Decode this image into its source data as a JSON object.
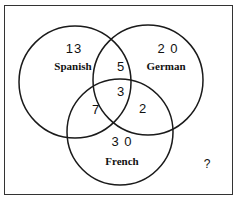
{
  "diagram": {
    "type": "venn",
    "sets": [
      {
        "name": "Spanish",
        "only": "13",
        "cx": 75,
        "cy": 82,
        "r": 56
      },
      {
        "name": "German",
        "only": "20",
        "cx": 148,
        "cy": 80,
        "r": 55
      },
      {
        "name": "French",
        "only": "30",
        "cx": 120,
        "cy": 132,
        "r": 53
      }
    ],
    "intersections": {
      "spanish_german": "5",
      "spanish_french": "7",
      "german_french": "2",
      "all_three": "3"
    },
    "outside": "?",
    "labels": {
      "spanish_count": "13",
      "spanish_name": "Spanish",
      "german_count": "2 0",
      "german_name": "German",
      "french_count": "3 0",
      "french_name": "French",
      "sg": "5",
      "sf": "7",
      "gf": "2",
      "sgf": "3",
      "outside": "?"
    },
    "colors": {
      "stroke": "#1a1a1a",
      "background": "#ffffff"
    }
  }
}
